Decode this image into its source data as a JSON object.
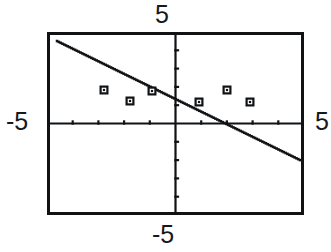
{
  "figure": {
    "kind": "graphing-calculator-plot",
    "background_color": "#ffffff",
    "ink_color": "#111214",
    "frame": {
      "left_px": 47,
      "top_px": 32,
      "width_px": 257,
      "height_px": 183,
      "border_width_px": 3
    }
  },
  "labels": {
    "top": "5",
    "left": "-5",
    "right": "5",
    "bottom": "-5"
  },
  "chart_data": {
    "type": "scatter",
    "title": "",
    "xlabel": "",
    "ylabel": "",
    "xlim": [
      -5,
      5
    ],
    "ylim": [
      -5,
      5
    ],
    "grid": false,
    "legend": "none",
    "axes": {
      "x_axis_y_value": 0,
      "y_axis_x_value": 0,
      "x_tick_interval": 1,
      "y_tick_interval": 1,
      "x_ticks": [
        -5,
        -4,
        -3,
        -2,
        -1,
        0,
        1,
        2,
        3,
        4,
        5
      ],
      "y_ticks": [
        -5,
        -4,
        -3,
        -2,
        -1,
        0,
        1,
        2,
        3,
        4,
        5
      ],
      "tick_style": "hash-marks-on-axis"
    },
    "series": [
      {
        "name": "data points",
        "marker": "open-square",
        "x": [
          -2.88,
          -1.88,
          -1.0,
          0.81,
          1.9,
          2.8
        ],
        "y": [
          0.87,
          0.57,
          0.84,
          0.54,
          0.87,
          0.54
        ],
        "points_px": [
          {
            "x": 104,
            "y": 90
          },
          {
            "x": 130,
            "y": 101
          },
          {
            "x": 152,
            "y": 91
          },
          {
            "x": 199,
            "y": 102
          },
          {
            "x": 227,
            "y": 90
          },
          {
            "x": 250,
            "y": 102
          }
        ]
      },
      {
        "name": "regression line",
        "type": "line",
        "style": "dotted-pixelated",
        "slope": -0.539,
        "intercept": 0.318,
        "endpoints": [
          {
            "x": -4.7,
            "y": 2.21
          },
          {
            "x": 4.77,
            "y": -2.07
          }
        ],
        "endpoints_px": [
          {
            "x": 57,
            "y": 41
          },
          {
            "x": 300,
            "y": 160
          }
        ]
      }
    ],
    "annotations": [
      {
        "text": "5",
        "position": "top-outside-center"
      },
      {
        "text": "-5",
        "position": "left-outside-middle"
      },
      {
        "text": "5",
        "position": "right-outside-middle"
      },
      {
        "text": "-5",
        "position": "bottom-outside-center"
      }
    ]
  }
}
